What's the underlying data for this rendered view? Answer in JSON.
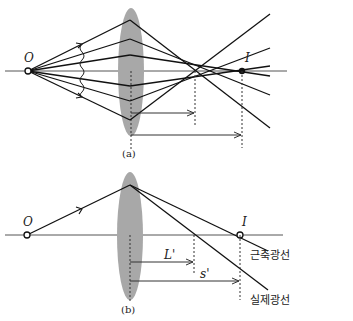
{
  "figure_a": {
    "caption": "(a)",
    "object_label": "O",
    "image_label": "I"
  },
  "figure_b": {
    "caption": "(b)",
    "object_label": "O",
    "image_label": "I",
    "dim_L_label": "L'",
    "dim_S_label": "s'",
    "paraxial_ray_label": "근축광선",
    "real_ray_label": "실제광선"
  },
  "colors": {
    "lens": "#a8a8a8",
    "line": "#1a1a1a",
    "dash": "#333333"
  }
}
